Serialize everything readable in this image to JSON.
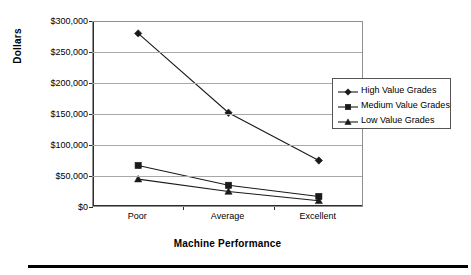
{
  "chart_data": {
    "type": "line",
    "title": "",
    "xlabel": "Machine Performance",
    "ylabel": "Dollars",
    "categories": [
      "Poor",
      "Average",
      "Excellent"
    ],
    "ylim": [
      0,
      300000
    ],
    "ytick_values": [
      0,
      50000,
      100000,
      150000,
      200000,
      250000,
      300000
    ],
    "ytick_labels": [
      "$0",
      "$50,000",
      "$100,000",
      "$150,000",
      "$200,000",
      "$250,000",
      "$300,000"
    ],
    "grid": true,
    "legend_position": "right",
    "series": [
      {
        "name": "High Value Grades",
        "marker": "diamond",
        "values": [
          280000,
          152000,
          75000
        ]
      },
      {
        "name": "Medium Value Grades",
        "marker": "square",
        "values": [
          67000,
          35000,
          17000
        ]
      },
      {
        "name": "Low Value Grades",
        "marker": "triangle",
        "values": [
          45000,
          25000,
          10000
        ]
      }
    ],
    "colors": {
      "line": "#1a1a1a",
      "grid": "#a8a8a8",
      "axis": "#2b2b2b",
      "background": "#ffffff"
    }
  }
}
